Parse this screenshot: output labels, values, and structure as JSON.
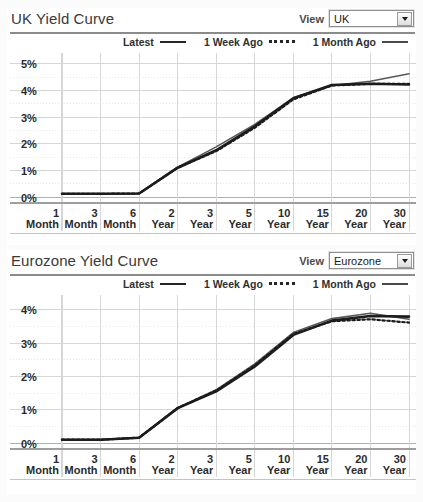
{
  "charts": [
    {
      "title": "UK Yield Curve",
      "view_label": "View",
      "view_value": "UK",
      "legend": [
        {
          "name": "Latest",
          "style": "solid"
        },
        {
          "name": "1 Week Ago",
          "style": "dotted"
        },
        {
          "name": "1 Month Ago",
          "style": "solid-thin"
        }
      ],
      "chart_data": {
        "type": "line",
        "title": "UK Yield Curve",
        "xlabel": "",
        "ylabel": "",
        "grid": true,
        "legend_position": "top-right",
        "categories": [
          "1 Month",
          "3 Month",
          "6 Month",
          "2 Year",
          "3 Year",
          "5 Year",
          "10 Year",
          "15 Year",
          "20 Year",
          "30 Year"
        ],
        "x_tick_lines": [
          [
            "1",
            "Month"
          ],
          [
            "3",
            "Month"
          ],
          [
            "6",
            "Month"
          ],
          [
            "2",
            "Year"
          ],
          [
            "3",
            "Year"
          ],
          [
            "5",
            "Year"
          ],
          [
            "10",
            "Year"
          ],
          [
            "15",
            "Year"
          ],
          [
            "20",
            "Year"
          ],
          [
            "30",
            "Year"
          ]
        ],
        "ylim": [
          0,
          5.4
        ],
        "yticks": [
          0,
          1,
          2,
          3,
          4,
          5
        ],
        "ytick_labels": [
          "0%",
          "1%",
          "2%",
          "3%",
          "4%",
          "5%"
        ],
        "series": [
          {
            "name": "Latest",
            "values": [
              0.12,
              0.12,
              0.13,
              1.1,
              1.75,
              2.65,
              3.7,
              4.2,
              4.25,
              4.22
            ]
          },
          {
            "name": "1 Week Ago",
            "values": [
              0.12,
              0.12,
              0.13,
              1.1,
              1.72,
              2.6,
              3.66,
              4.18,
              4.24,
              4.24
            ]
          },
          {
            "name": "1 Month Ago",
            "values": [
              0.12,
              0.12,
              0.13,
              1.12,
              1.88,
              2.72,
              3.72,
              4.18,
              4.34,
              4.62
            ]
          }
        ]
      }
    },
    {
      "title": "Eurozone Yield Curve",
      "view_label": "View",
      "view_value": "Eurozone",
      "legend": [
        {
          "name": "Latest",
          "style": "solid"
        },
        {
          "name": "1 Week Ago",
          "style": "dotted"
        },
        {
          "name": "1 Month Ago",
          "style": "solid-thin"
        }
      ],
      "chart_data": {
        "type": "line",
        "title": "Eurozone Yield Curve",
        "xlabel": "",
        "ylabel": "",
        "grid": true,
        "legend_position": "top-right",
        "categories": [
          "1 Month",
          "3 Month",
          "6 Month",
          "2 Year",
          "3 Year",
          "5 Year",
          "10 Year",
          "15 Year",
          "20 Year",
          "30 Year"
        ],
        "x_tick_lines": [
          [
            "1",
            "Month"
          ],
          [
            "3",
            "Month"
          ],
          [
            "6",
            "Month"
          ],
          [
            "2",
            "Year"
          ],
          [
            "3",
            "Year"
          ],
          [
            "5",
            "Year"
          ],
          [
            "10",
            "Year"
          ],
          [
            "15",
            "Year"
          ],
          [
            "20",
            "Year"
          ],
          [
            "30",
            "Year"
          ]
        ],
        "ylim": [
          0,
          4.45
        ],
        "yticks": [
          0,
          1,
          2,
          3,
          4
        ],
        "ytick_labels": [
          "0%",
          "1%",
          "2%",
          "3%",
          "4%"
        ],
        "series": [
          {
            "name": "Latest",
            "values": [
              0.1,
              0.1,
              0.16,
              1.05,
              1.55,
              2.3,
              3.25,
              3.68,
              3.82,
              3.8
            ]
          },
          {
            "name": "1 Week Ago",
            "values": [
              0.1,
              0.1,
              0.16,
              1.05,
              1.58,
              2.34,
              3.28,
              3.66,
              3.72,
              3.62
            ]
          },
          {
            "name": "1 Month Ago",
            "values": [
              0.1,
              0.1,
              0.16,
              1.06,
              1.6,
              2.38,
              3.32,
              3.74,
              3.9,
              3.72
            ]
          }
        ]
      }
    }
  ],
  "colors": {
    "line_latest": "#1c1c1c",
    "line_week": "#1c1c1c",
    "line_month": "#595959",
    "grid": "#d6d6d6",
    "grid_minor": "#e9e9e9",
    "axis": "#b0b0b0",
    "text": "#333333",
    "rule": "#8b8b8b"
  }
}
